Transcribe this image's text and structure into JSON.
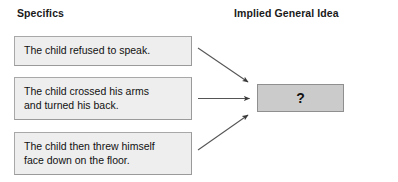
{
  "diagram": {
    "type": "specifics-to-general-idea-inference",
    "columns": [
      {
        "id": "specifics",
        "label": "Specifics"
      },
      {
        "id": "implied_general_idea",
        "label": "Implied General Idea"
      }
    ],
    "specifics": [
      {
        "id": "detail-1",
        "text": "The child refused to speak."
      },
      {
        "id": "detail-2",
        "text": "The child crossed his arms\nand turned his back."
      },
      {
        "id": "detail-3",
        "text": "The child then threw himself\nface down on the floor."
      }
    ],
    "conclusion": {
      "label": "?",
      "fill": "#cbcbcb",
      "border": "#8f8f8f"
    },
    "arrows": [
      {
        "id": "arrow-detail-1",
        "from": "detail-1",
        "to": "conclusion"
      },
      {
        "id": "arrow-detail-2",
        "from": "detail-2",
        "to": "conclusion"
      },
      {
        "id": "arrow-detail-3",
        "from": "detail-3",
        "to": "conclusion"
      }
    ],
    "colors": {
      "background": "#ffffff",
      "box_fill": "#eeeeee",
      "box_border": "#a8a8a8",
      "text": "#111111",
      "arrow": "#444444"
    }
  }
}
